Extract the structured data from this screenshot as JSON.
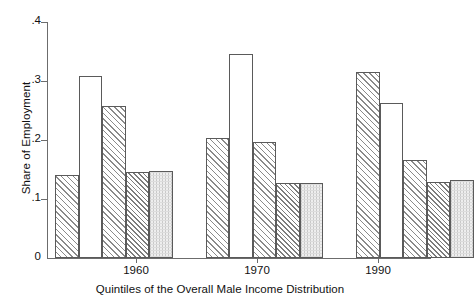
{
  "chart_data": {
    "type": "bar",
    "title": "",
    "subtitle": "",
    "xlabel": "Quintiles of the Overall Male Income Distribution",
    "ylabel": "Share of Employment",
    "ylim": [
      0,
      0.4
    ],
    "yticks": [
      "0",
      ".1",
      ".2",
      ".3",
      ".4"
    ],
    "ytick_values": [
      0,
      0.1,
      0.2,
      0.3,
      0.4
    ],
    "grid": false,
    "legend": "none",
    "categories": [
      "1960",
      "1970",
      "1990"
    ],
    "series": [
      {
        "name": "Quintile 1",
        "pattern": "diagonal-hatch",
        "values": [
          0.141,
          0.203,
          0.315
        ]
      },
      {
        "name": "Quintile 2",
        "pattern": "blank",
        "values": [
          0.308,
          0.345,
          0.263
        ]
      },
      {
        "name": "Quintile 3",
        "pattern": "diagonal-hatch",
        "values": [
          0.258,
          0.197,
          0.166
        ]
      },
      {
        "name": "Quintile 4",
        "pattern": "cross-hatch",
        "values": [
          0.146,
          0.127,
          0.129
        ]
      },
      {
        "name": "Quintile 5",
        "pattern": "fine-dots",
        "values": [
          0.148,
          0.127,
          0.132
        ]
      }
    ]
  },
  "axes": {
    "y_title": "Share of Employment",
    "x_title": "Quintiles of the Overall Male Income Distribution",
    "y_tick_labels": [
      ".4",
      ".3",
      ".2",
      ".1",
      "0"
    ],
    "x_group_labels": [
      "1960",
      "1970",
      "1990"
    ]
  },
  "colors": {
    "axis": "#6c6c6c",
    "bar_outline": "#5a5a5a",
    "hatch": "#8a8a8a",
    "text": "#111111",
    "background": "#ffffff"
  }
}
